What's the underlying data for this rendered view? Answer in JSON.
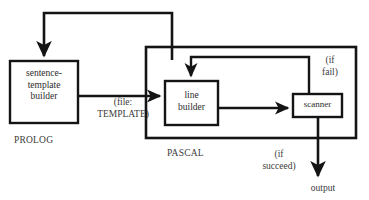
{
  "diagram": {
    "stroke_color": "#141414",
    "text_color": "#2b2b2b",
    "background": "#ffffff",
    "nodes": [
      {
        "id": "sentence-template-builder",
        "label": "sentence-\ntemplate\nbuilder",
        "x": 10,
        "y": 61,
        "w": 68,
        "h": 62
      },
      {
        "id": "line-builder",
        "label": "line\nbuilder",
        "x": 165,
        "y": 81,
        "w": 53,
        "h": 44
      },
      {
        "id": "scanner",
        "label": "scanner",
        "x": 293,
        "y": 94,
        "w": 49,
        "h": 23
      }
    ],
    "groups": [
      {
        "id": "prolog-group",
        "label": "PROLOG",
        "label_x": 14,
        "label_y": 135
      },
      {
        "id": "pascal-group",
        "label": "PASCAL",
        "label_x": 167,
        "label_y": 148,
        "box": {
          "x": 146,
          "y": 47,
          "w": 210,
          "h": 91
        }
      }
    ],
    "edge_labels": [
      {
        "id": "file-template-label",
        "label": "(file:\nTEMPLATE)",
        "x": 88,
        "y": 96,
        "w": 70
      },
      {
        "id": "if-fail-label",
        "label": "(if\nfail)",
        "x": 313,
        "y": 54,
        "w": 34
      },
      {
        "id": "if-succeed-label",
        "label": "(if\nsucceed)",
        "x": 248,
        "y": 148,
        "w": 62
      },
      {
        "id": "output-label",
        "label": "output",
        "x": 300,
        "y": 182,
        "w": 46
      }
    ],
    "edges": [
      {
        "id": "template-to-line-builder",
        "from": "sentence-template-builder",
        "to": "line-builder",
        "kind": "arrow"
      },
      {
        "id": "line-builder-to-scanner",
        "from": "line-builder",
        "to": "scanner",
        "kind": "arrow"
      },
      {
        "id": "scanner-fail-to-line-builder",
        "from": "scanner",
        "to": "line-builder",
        "kind": "feedback-arrow",
        "condition": "(if fail)"
      },
      {
        "id": "scanner-succeed-to-output",
        "from": "scanner",
        "to": "output",
        "kind": "arrow",
        "condition": "(if succeed)"
      },
      {
        "id": "pascal-back-to-template-builder",
        "from": "pascal-group",
        "to": "sentence-template-builder",
        "kind": "feedback-arrow"
      }
    ]
  }
}
